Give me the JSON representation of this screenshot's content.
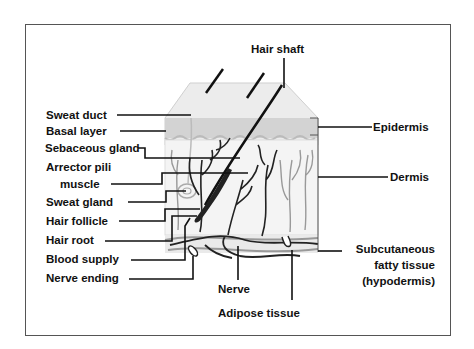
{
  "diagram": {
    "labels": {
      "hair_shaft": "Hair shaft",
      "sweat_duct": "Sweat duct",
      "basal_layer": "Basal layer",
      "sebaceous_gland": "Sebaceous gland",
      "arrector_pili_1": "Arrector pili",
      "arrector_pili_2": "muscle",
      "sweat_gland": "Sweat gland",
      "hair_follicle": "Hair follicle",
      "hair_root": "Hair root",
      "blood_supply": "Blood supply",
      "nerve_ending": "Nerve ending",
      "nerve": "Nerve",
      "adipose_tissue": "Adipose tissue",
      "epidermis": "Epidermis",
      "dermis": "Dermis",
      "subcutaneous_1": "Subcutaneous",
      "subcutaneous_2": "fatty tissue",
      "subcutaneous_3": "(hypodermis)"
    },
    "colors": {
      "leader_line": "#111111",
      "epidermis_fill": "#d6d6d6",
      "surface_fill": "#ececec",
      "dermis_fill": "#f3f3f3",
      "vessel": "#222222",
      "frame": "#555555"
    }
  }
}
